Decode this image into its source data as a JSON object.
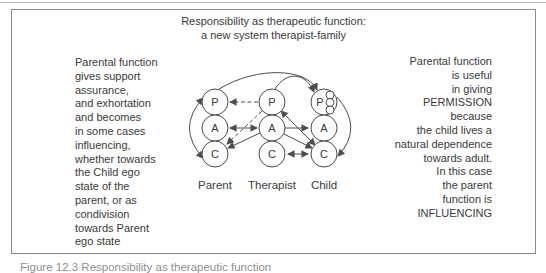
{
  "box": {
    "title": "Responsibility as therapeutic function:\na new system therapist-family",
    "left_note": "Parental function\ngives support\nassurance,\nand exhortation\nand becomes\nin some cases\ninfluencing,\nwhether towards\nthe Child ego\nstate of the\nparent, or as\ncondivision\ntowards Parent\nego state",
    "right_note": "Parental function\nis useful\nin giving\nPERMISSION\nbecause\nthe child lives a\nnatural dependence\ntowards adult.\nIn this case\nthe parent\nfunction is\nINFLUENCING"
  },
  "diagram": {
    "columns": [
      {
        "name": "Parent",
        "circles": [
          "P",
          "A",
          "C"
        ]
      },
      {
        "name": "Therapist",
        "circles": [
          "P",
          "A",
          "C"
        ]
      },
      {
        "name": "Child",
        "circles": [
          "P",
          "A",
          "C"
        ]
      }
    ],
    "child_p_inner_circles": 3,
    "relations": [
      {
        "from": "Therapist.P",
        "to": "Parent.P",
        "style": "dashed",
        "heads": "single"
      },
      {
        "from": "Therapist.P",
        "to": "Parent.C",
        "style": "dashed",
        "heads": "single"
      },
      {
        "from": "Parent.A",
        "to": "Therapist.A",
        "style": "solid",
        "heads": "double"
      },
      {
        "from": "Therapist.A",
        "to": "Parent.C",
        "style": "solid",
        "heads": "single"
      },
      {
        "from": "Therapist.A",
        "to": "Child.A",
        "style": "solid",
        "heads": "single"
      },
      {
        "from": "Therapist.A",
        "to": "Child.C",
        "style": "solid",
        "heads": "single"
      },
      {
        "from": "Therapist.P",
        "to": "Child.C",
        "style": "solid",
        "heads": "double"
      },
      {
        "from": "Therapist.C",
        "to": "Child.C",
        "style": "solid",
        "heads": "double"
      },
      {
        "from": "Parent.P",
        "to": "Parent.C",
        "style": "arc-left",
        "heads": "double"
      },
      {
        "from": "Child.P",
        "to": "Child.C",
        "style": "arc-right",
        "heads": "single"
      },
      {
        "from": "Parent.P",
        "to": "Child.P",
        "style": "arc-top",
        "heads": "single"
      },
      {
        "from": "Therapist.P",
        "to": "Child.P",
        "style": "arc-top",
        "heads": "single"
      }
    ]
  },
  "caption": "Figure 12.3 Responsibility as therapeutic function",
  "colors": {
    "line": "#4d4d4d",
    "text": "#3a3a3a",
    "frame_border": "#8a8a8a",
    "background": "#ffffff"
  }
}
